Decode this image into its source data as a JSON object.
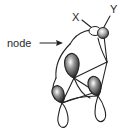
{
  "diagram": {
    "type": "molecular-orbital-sketch",
    "labels": {
      "node": "node",
      "x": "X",
      "y": "Y"
    },
    "colors": {
      "line": "#222222",
      "lobe_dark": "#333333",
      "lobe_light": "#ffffff",
      "background": "#ffffff"
    },
    "elements": [
      {
        "id": "node-arrow",
        "description": "arrow pointing from 'node' label to orbital boundary"
      },
      {
        "id": "xy-atom-pair",
        "description": "small orbital lobes at X and Y positions"
      },
      {
        "id": "p-orbital-upper",
        "description": "upper p-orbital, shaded lobe"
      },
      {
        "id": "p-orbital-right",
        "description": "right p-orbital, shaded upper lobe, open lower lobe"
      },
      {
        "id": "p-orbital-left",
        "description": "lower-left p-orbital, shaded upper lobe, open lower lobe"
      }
    ]
  }
}
